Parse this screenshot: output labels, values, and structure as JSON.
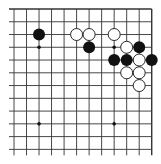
{
  "diagram": {
    "type": "go-board-fragment",
    "region": "top-right corner",
    "columns": 12,
    "rows": 12,
    "edges": {
      "top": true,
      "right": true,
      "left": false,
      "bottom": false
    },
    "origin_x": 14,
    "origin_y": 9,
    "spacing_x": 12.52,
    "spacing_y": 12.76,
    "stone_radius": 6,
    "colors": {
      "line": "#333333",
      "black": "#111111",
      "white": "#ffffff",
      "background": "#ffffff"
    },
    "star_points": [
      [
        2,
        3
      ],
      [
        8,
        3
      ],
      [
        2,
        9
      ],
      [
        8,
        9
      ]
    ],
    "stones": [
      {
        "color": "black",
        "col": 2,
        "row": 2
      },
      {
        "color": "white",
        "col": 5,
        "row": 2
      },
      {
        "color": "white",
        "col": 6,
        "row": 2
      },
      {
        "color": "white",
        "col": 8,
        "row": 2
      },
      {
        "color": "black",
        "col": 6,
        "row": 3
      },
      {
        "color": "white",
        "col": 9,
        "row": 3
      },
      {
        "color": "black",
        "col": 10,
        "row": 3
      },
      {
        "color": "black",
        "col": 8,
        "row": 4
      },
      {
        "color": "black",
        "col": 9,
        "row": 4
      },
      {
        "color": "white",
        "col": 10,
        "row": 4
      },
      {
        "color": "black",
        "col": 11,
        "row": 4
      },
      {
        "color": "white",
        "col": 9,
        "row": 5
      },
      {
        "color": "white",
        "col": 10,
        "row": 5
      },
      {
        "color": "white",
        "col": 10,
        "row": 6
      }
    ]
  }
}
